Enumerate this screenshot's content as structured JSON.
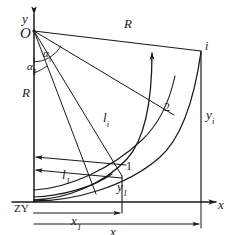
{
  "figure": {
    "type": "geometric-diagram",
    "background_color": "#ffffff",
    "line_color": "#1a1a1a"
  },
  "axes": {
    "y_label": "y",
    "x_label": "x",
    "origin_label": "O",
    "station_label": "ZY"
  },
  "radii": {
    "vertical_label": "R",
    "vertical_sub": "",
    "chord_label": "R",
    "chord_sub": ""
  },
  "angles": [
    {
      "name": "alpha-1",
      "symbol": "α",
      "sub": "1"
    },
    {
      "name": "alpha-i",
      "symbol": "α",
      "sub": "i"
    }
  ],
  "arc_lengths": [
    {
      "name": "l-1",
      "symbol": "l",
      "sub": "1"
    },
    {
      "name": "l-i",
      "symbol": "l",
      "sub": "i"
    }
  ],
  "points": [
    {
      "name": "point-1",
      "label": "1"
    },
    {
      "name": "point-2",
      "label": "2"
    },
    {
      "name": "point-i",
      "label": "i"
    }
  ],
  "ordinates": [
    {
      "name": "y-1",
      "symbol": "y",
      "sub": "1"
    },
    {
      "name": "y-i",
      "symbol": "y",
      "sub": "i"
    }
  ],
  "abscissas": [
    {
      "name": "x-1",
      "symbol": "x",
      "sub": "1"
    },
    {
      "name": "x-i",
      "symbol": "x",
      "sub": "i"
    }
  ]
}
